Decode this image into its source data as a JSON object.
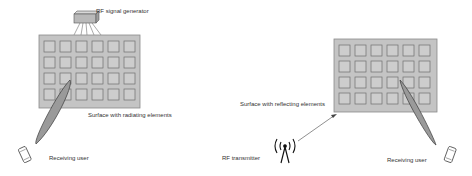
{
  "left_scenario": {
    "generator_label": "RF signal generator",
    "surface_label": "Surface with radiating elements",
    "user_label": "Receiving user",
    "grid": {
      "rows": 4,
      "cols": 6
    }
  },
  "right_scenario": {
    "surface_label": "Surface with reflecting elements",
    "transmitter_label": "RF transmitter",
    "user_label": "Receiving user",
    "grid": {
      "rows": 4,
      "cols": 6
    }
  },
  "colors": {
    "panel_fill": "#c4c4c4",
    "panel_stroke": "#8a8a8a",
    "element_fill": "#cdcdcd",
    "element_stroke": "#6e6e6e",
    "beam_fill": "#9a9a9a",
    "beam_stroke": "#3a3a3a"
  }
}
